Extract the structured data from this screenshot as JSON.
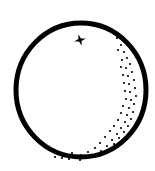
{
  "illustration": {
    "subject": "orange",
    "icon": "orange-fruit-icon",
    "colors": {
      "background": "#ffffff",
      "ink": "#000000"
    },
    "outline": {
      "cx": 81,
      "cy": 90,
      "rx": 65,
      "ry": 67,
      "stroke_width": 5
    },
    "stem": {
      "icon": "four-point-star-icon",
      "cx": 80,
      "cy": 40,
      "size": 6
    },
    "stipple_dots": [
      [
        117,
        38
      ],
      [
        121,
        45
      ],
      [
        124,
        52
      ],
      [
        118,
        50
      ],
      [
        127,
        58
      ],
      [
        122,
        60
      ],
      [
        130,
        64
      ],
      [
        126,
        68
      ],
      [
        121,
        67
      ],
      [
        132,
        72
      ],
      [
        128,
        76
      ],
      [
        123,
        75
      ],
      [
        134,
        80
      ],
      [
        129,
        84
      ],
      [
        124,
        83
      ],
      [
        135,
        88
      ],
      [
        130,
        92
      ],
      [
        125,
        91
      ],
      [
        136,
        96
      ],
      [
        131,
        100
      ],
      [
        126,
        99
      ],
      [
        134,
        104
      ],
      [
        129,
        108
      ],
      [
        123,
        106
      ],
      [
        133,
        112
      ],
      [
        127,
        115
      ],
      [
        121,
        113
      ],
      [
        131,
        119
      ],
      [
        125,
        122
      ],
      [
        118,
        120
      ],
      [
        128,
        126
      ],
      [
        121,
        128
      ],
      [
        114,
        126
      ],
      [
        124,
        132
      ],
      [
        117,
        134
      ],
      [
        110,
        131
      ],
      [
        119,
        138
      ],
      [
        112,
        140
      ],
      [
        105,
        137
      ],
      [
        114,
        144
      ],
      [
        107,
        146
      ],
      [
        100,
        143
      ],
      [
        108,
        150
      ],
      [
        101,
        151
      ],
      [
        95,
        148
      ],
      [
        94,
        155
      ],
      [
        88,
        152
      ],
      [
        87,
        158
      ],
      [
        81,
        155
      ],
      [
        80,
        160
      ],
      [
        75,
        157
      ],
      [
        72,
        153
      ],
      [
        69,
        159
      ],
      [
        66,
        155
      ],
      [
        62,
        158
      ],
      [
        58,
        154
      ],
      [
        55,
        157
      ]
    ]
  }
}
